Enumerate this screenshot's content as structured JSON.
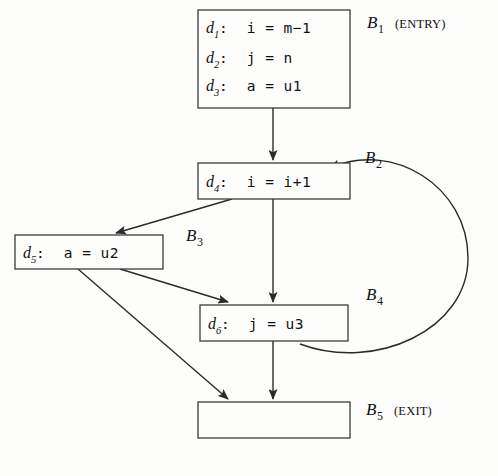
{
  "diagram": {
    "kind": "control-flow-graph",
    "blocks": [
      {
        "id": "B1",
        "label": "B",
        "subscript": "1",
        "tag": "(ENTRY)",
        "statements": [
          {
            "def": "d",
            "def_sub": "1",
            "code": ":  i = m−1"
          },
          {
            "def": "d",
            "def_sub": "2",
            "code": ":  j = n"
          },
          {
            "def": "d",
            "def_sub": "3",
            "code": ":  a = u1"
          }
        ]
      },
      {
        "id": "B2",
        "label": "B",
        "subscript": "2",
        "tag": "",
        "statements": [
          {
            "def": "d",
            "def_sub": "4",
            "code": ":  i = i+1"
          }
        ]
      },
      {
        "id": "B3",
        "label": "B",
        "subscript": "3",
        "tag": "",
        "statements": [
          {
            "def": "d",
            "def_sub": "5",
            "code": ":  a = u2"
          }
        ]
      },
      {
        "id": "B4",
        "label": "B",
        "subscript": "4",
        "tag": "",
        "statements": [
          {
            "def": "d",
            "def_sub": "6",
            "code": ":  j = u3"
          }
        ]
      },
      {
        "id": "B5",
        "label": "B",
        "subscript": "5",
        "tag": "(EXIT)",
        "statements": []
      }
    ],
    "edges": [
      {
        "from": "B1",
        "to": "B2"
      },
      {
        "from": "B2",
        "to": "B3"
      },
      {
        "from": "B2",
        "to": "B4"
      },
      {
        "from": "B3",
        "to": "B4"
      },
      {
        "from": "B3",
        "to": "B5"
      },
      {
        "from": "B4",
        "to": "B5"
      },
      {
        "from": "B4",
        "to": "B2"
      }
    ]
  },
  "colors": {
    "background": "#fdfdfc",
    "stroke": "#2b2b2b",
    "box_stroke": "#3c3c3c",
    "text": "#111111"
  }
}
